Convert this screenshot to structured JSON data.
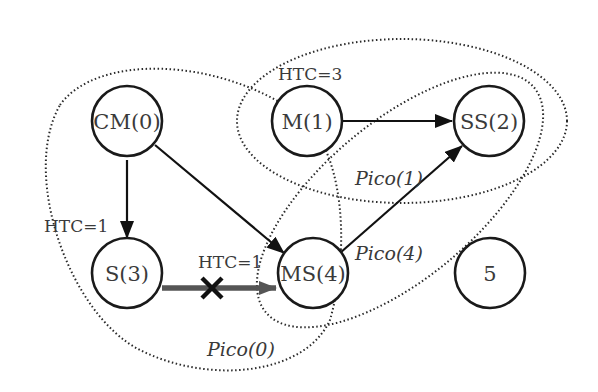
{
  "diagram": {
    "type": "pico-network-graph",
    "nodes": [
      {
        "id": "CM0",
        "label": "CM(0)",
        "x": 127,
        "y": 125
      },
      {
        "id": "M1",
        "label": "M(1)",
        "x": 307,
        "y": 125
      },
      {
        "id": "SS2",
        "label": "SS(2)",
        "x": 489,
        "y": 125
      },
      {
        "id": "S3",
        "label": "S(3)",
        "x": 127,
        "y": 275
      },
      {
        "id": "MS4",
        "label": "MS(4)",
        "x": 313,
        "y": 275
      },
      {
        "id": "N5",
        "label": "5",
        "x": 490,
        "y": 275
      }
    ],
    "edges": [
      {
        "from": "CM0",
        "to": "S3",
        "style": "solid"
      },
      {
        "from": "CM0",
        "to": "MS4",
        "style": "solid"
      },
      {
        "from": "M1",
        "to": "SS2",
        "style": "solid"
      },
      {
        "from": "MS4",
        "to": "SS2",
        "style": "solid"
      },
      {
        "from": "S3",
        "to": "MS4",
        "style": "blocked",
        "marker": "X"
      }
    ],
    "htc_labels": [
      {
        "text": "HTC=3",
        "near": "M1"
      },
      {
        "text": "HTC=1",
        "near": "S3"
      },
      {
        "text": "HTC=1",
        "near": "S3-MS4 edge"
      }
    ],
    "pico_regions": [
      {
        "label": "Pico(0)",
        "members": [
          "CM0",
          "S3",
          "MS4"
        ]
      },
      {
        "label": "Pico(1)",
        "members": [
          "M1",
          "SS2"
        ]
      },
      {
        "label": "Pico(4)",
        "members": [
          "MS4",
          "SS2"
        ]
      }
    ]
  },
  "labels": {
    "cm0": "CM(0)",
    "m1": "M(1)",
    "ss2": "SS(2)",
    "s3": "S(3)",
    "ms4": "MS(4)",
    "n5": "5",
    "htc_m1": "HTC=3",
    "htc_s3": "HTC=1",
    "htc_edge": "HTC=1",
    "pico0": "Pico(0)",
    "pico1": "Pico(1)",
    "pico4": "Pico(4)"
  }
}
